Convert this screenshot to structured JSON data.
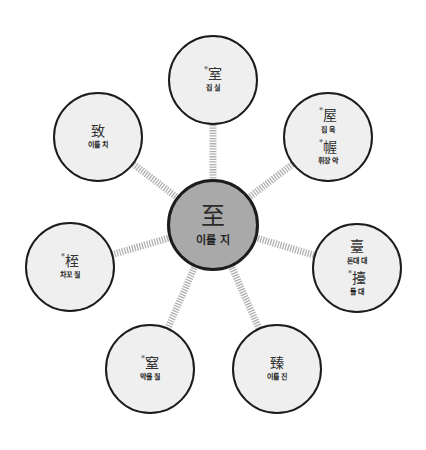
{
  "center": {
    "hanja": "至",
    "reading": "이를 지"
  },
  "nodes": [
    {
      "id": "top",
      "entries": [
        {
          "star": "*",
          "hanja": "室",
          "reading": "집 실"
        }
      ]
    },
    {
      "id": "top-right",
      "entries": [
        {
          "star": "*",
          "hanja": "屋",
          "reading": "집 옥"
        },
        {
          "star": "*",
          "hanja": "幄",
          "reading": "휘장 악"
        }
      ]
    },
    {
      "id": "right",
      "entries": [
        {
          "star": "",
          "hanja": "臺",
          "reading": "돈대 대"
        },
        {
          "star": "*",
          "hanja": "擡",
          "reading": "들 대"
        }
      ]
    },
    {
      "id": "bottom-right",
      "entries": [
        {
          "star": "",
          "hanja": "臻",
          "reading": "이를 진"
        }
      ]
    },
    {
      "id": "bottom-left",
      "entries": [
        {
          "star": "*",
          "hanja": "窒",
          "reading": "막을 질"
        }
      ]
    },
    {
      "id": "left",
      "entries": [
        {
          "star": "*",
          "hanja": "桎",
          "reading": "차꼬 질"
        }
      ]
    },
    {
      "id": "top-left",
      "entries": [
        {
          "star": "",
          "hanja": "致",
          "reading": "이를 치"
        }
      ]
    }
  ],
  "colors": {
    "center_fill": "#a9a9a9",
    "node_fill": "#efefef",
    "border": "#1c1c1c",
    "connector": "#b5b5b5"
  }
}
